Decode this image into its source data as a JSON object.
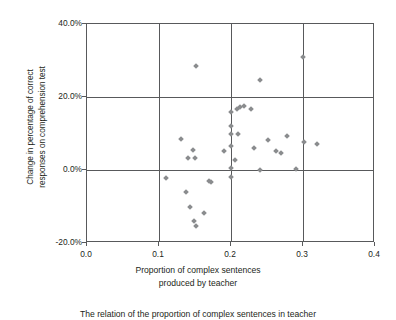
{
  "chart_data": {
    "type": "scatter",
    "title": "",
    "xlabel": "Proportion of complex sentences produced by teacher",
    "ylabel": "Change in percentage of correct responses on comprehension test",
    "xlim": [
      0.0,
      0.4
    ],
    "ylim": [
      -0.2,
      0.4
    ],
    "grid": true,
    "legend": "none",
    "marker": {
      "shape": "diamond",
      "color": "#8a8c8e",
      "size_px": 4
    },
    "xticks": [
      "0.0",
      "0.1",
      "0.2",
      "0.3",
      "0.4"
    ],
    "xtick_values": [
      0.0,
      0.1,
      0.2,
      0.3,
      0.4
    ],
    "yticks": [
      "40.0%",
      "20.0%",
      "0.0%",
      "-20.0%"
    ],
    "ytick_values": [
      0.4,
      0.2,
      0.0,
      -0.2
    ],
    "series": [
      {
        "name": "teachers",
        "points": [
          {
            "x": 0.11,
            "y": -0.022
          },
          {
            "x": 0.13,
            "y": 0.085
          },
          {
            "x": 0.138,
            "y": -0.06
          },
          {
            "x": 0.14,
            "y": 0.033
          },
          {
            "x": 0.143,
            "y": -0.102
          },
          {
            "x": 0.147,
            "y": 0.055
          },
          {
            "x": 0.148,
            "y": -0.14
          },
          {
            "x": 0.15,
            "y": 0.033
          },
          {
            "x": 0.152,
            "y": 0.285
          },
          {
            "x": 0.152,
            "y": -0.152
          },
          {
            "x": 0.162,
            "y": -0.118
          },
          {
            "x": 0.17,
            "y": -0.03
          },
          {
            "x": 0.172,
            "y": -0.033
          },
          {
            "x": 0.19,
            "y": 0.053
          },
          {
            "x": 0.2,
            "y": 0.16
          },
          {
            "x": 0.2,
            "y": 0.12
          },
          {
            "x": 0.2,
            "y": 0.098
          },
          {
            "x": 0.2,
            "y": 0.067
          },
          {
            "x": 0.2,
            "y": 0.005
          },
          {
            "x": 0.2,
            "y": -0.018
          },
          {
            "x": 0.205,
            "y": 0.027
          },
          {
            "x": 0.208,
            "y": 0.168
          },
          {
            "x": 0.21,
            "y": 0.1
          },
          {
            "x": 0.212,
            "y": 0.172
          },
          {
            "x": 0.218,
            "y": 0.175
          },
          {
            "x": 0.228,
            "y": 0.168
          },
          {
            "x": 0.232,
            "y": 0.06
          },
          {
            "x": 0.24,
            "y": 0.248
          },
          {
            "x": 0.24,
            "y": -0.001
          },
          {
            "x": 0.252,
            "y": 0.082
          },
          {
            "x": 0.262,
            "y": 0.052
          },
          {
            "x": 0.27,
            "y": 0.048
          },
          {
            "x": 0.278,
            "y": 0.092
          },
          {
            "x": 0.29,
            "y": 0.003
          },
          {
            "x": 0.3,
            "y": 0.31
          },
          {
            "x": 0.302,
            "y": 0.078
          },
          {
            "x": 0.32,
            "y": 0.072
          }
        ]
      }
    ]
  },
  "axes": {
    "y_title_lines": [
      "Change in percentage of correct",
      "responses on comprehension test"
    ],
    "x_title_lines": [
      "Proportion of complex sentences",
      "produced by teacher"
    ]
  },
  "caption": {
    "text": "The relation of the proportion of complex sentences in teacher"
  }
}
